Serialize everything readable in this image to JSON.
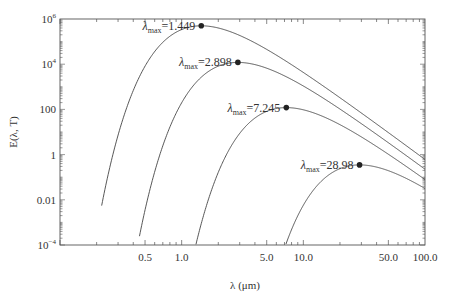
{
  "chart_data": {
    "type": "line",
    "title": "",
    "xlabel": "λ (μm)",
    "ylabel": "E(λ, T)",
    "xscale": "log",
    "yscale": "log",
    "xlim": [
      0.1,
      100.0
    ],
    "ylim": [
      0.0001,
      1000000
    ],
    "x_ticks": [
      {
        "value": 0.5,
        "label": "0.5"
      },
      {
        "value": 1.0,
        "label": "1.0"
      },
      {
        "value": 5.0,
        "label": "5.0"
      },
      {
        "value": 10.0,
        "label": "10.0"
      },
      {
        "value": 50.0,
        "label": "50.0"
      },
      {
        "value": 100.0,
        "label": "100.0"
      }
    ],
    "y_ticks": [
      {
        "value": 1000000,
        "label": "10",
        "sup": "6"
      },
      {
        "value": 10000,
        "label": "10",
        "sup": "4"
      },
      {
        "value": 100,
        "label": "100",
        "sup": ""
      },
      {
        "value": 1,
        "label": "1",
        "sup": ""
      },
      {
        "value": 0.01,
        "label": "0.01",
        "sup": ""
      },
      {
        "value": 0.0001,
        "label": "10",
        "sup": "−4"
      }
    ],
    "grid": false,
    "legend": null,
    "series": [
      {
        "name": "λmax=1.449",
        "lambda_max": 1.449,
        "peak_value": 500000,
        "x_start": 0.22,
        "y_start": 0.00018,
        "y_end_at_100": 1.5
      },
      {
        "name": "λmax=2.898",
        "lambda_max": 2.898,
        "peak_value": 12000,
        "x_start": 0.45,
        "y_start": 0.0001,
        "y_end_at_100": 0.8
      },
      {
        "name": "λmax=7.245",
        "lambda_max": 7.245,
        "peak_value": 120,
        "x_start": 1.2,
        "y_start": 0.0001,
        "y_end_at_100": 0.3
      },
      {
        "name": "λmax=28.98",
        "lambda_max": 28.98,
        "peak_value": 0.35,
        "x_start": 6.5,
        "y_start": 0.0001,
        "y_end_at_100": 0.06
      }
    ],
    "annotations": [
      {
        "prefix": "λ",
        "sub": "max",
        "text": "=1.449"
      },
      {
        "prefix": "λ",
        "sub": "max",
        "text": "=2.898"
      },
      {
        "prefix": "λ",
        "sub": "max",
        "text": "=7.245"
      },
      {
        "prefix": "λ",
        "sub": "max",
        "text": "=28.98"
      }
    ]
  }
}
